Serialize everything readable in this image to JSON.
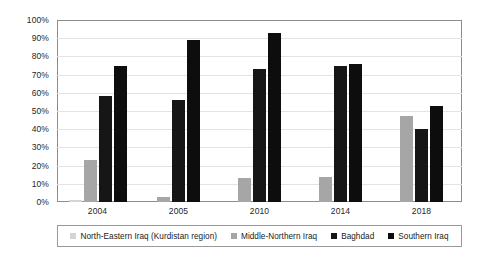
{
  "chart_data": {
    "type": "bar",
    "title": "",
    "subtitle": "",
    "xlabel": "",
    "ylabel": "",
    "ylim": [
      0,
      100
    ],
    "yticks": [
      "0%",
      "10%",
      "20%",
      "30%",
      "40%",
      "50%",
      "60%",
      "70%",
      "80%",
      "90%",
      "100%"
    ],
    "ytick_values": [
      0,
      10,
      20,
      30,
      40,
      50,
      60,
      70,
      80,
      90,
      100
    ],
    "grid": true,
    "legend_position": "bottom",
    "categories": [
      "2004",
      "2005",
      "2010",
      "2014",
      "2018"
    ],
    "series": [
      {
        "name": "North-Eastern Iraq (Kurdistan region)",
        "color": "#d4d4d4",
        "values": [
          1,
          0,
          0,
          0,
          0
        ]
      },
      {
        "name": "Middle-Northern Iraq",
        "color": "#a6a6a6",
        "values": [
          23,
          3,
          13,
          14,
          47
        ]
      },
      {
        "name": "Baghdad",
        "color": "#161616",
        "values": [
          58,
          56,
          73,
          75,
          40
        ]
      },
      {
        "name": "Southern Iraq",
        "color": "#0d0d0d",
        "values": [
          75,
          89,
          93,
          76,
          53
        ]
      }
    ]
  }
}
